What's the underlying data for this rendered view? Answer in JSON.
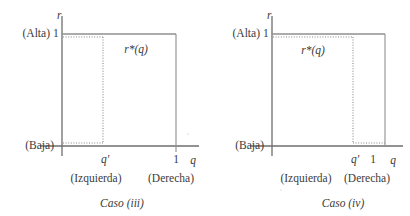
{
  "figure": {
    "panels": [
      {
        "id": "caso-iii",
        "caption": "Caso (iii)",
        "y_axis_name": "r",
        "x_axis_name": "q",
        "y_top_tick": "1",
        "y_top_qualifier": "(Alta)",
        "y_bottom_qualifier": "(Baja)",
        "x_ticks": [
          "q'",
          "1"
        ],
        "x_left_qualifier": "(Izquierda)",
        "x_right_qualifier": "(Derecha)",
        "curve_label": "r*(q)",
        "geometry": {
          "axis_x": 62,
          "baseline_y": 146,
          "top_y": 34,
          "q_prime_x": 103,
          "q_one_x": 176,
          "dotted_top_y": 37,
          "dotted_bottom_y": 143,
          "x_axis_end": 199,
          "y_axis_top": 16,
          "y_axis_bottom": 156
        }
      },
      {
        "id": "caso-iv",
        "caption": "Caso (iv)",
        "y_axis_name": "r",
        "x_axis_name": "q",
        "y_top_tick": "1",
        "y_top_qualifier": "(Alta)",
        "y_bottom_qualifier": "(Baja)",
        "x_ticks": [
          "q'",
          "1"
        ],
        "x_left_qualifier": "(Izquierda)",
        "x_right_qualifier": "(Derecha)",
        "curve_label": "r*(q)",
        "geometry": {
          "axis_x": 67,
          "baseline_y": 146,
          "top_y": 34,
          "q_prime_x": 148,
          "q_one_x": 167,
          "right_edge_x": 180,
          "dotted_top_y": 37,
          "dotted_bottom_y": 143,
          "x_axis_end": 198,
          "y_axis_top": 16,
          "y_axis_bottom": 156
        }
      }
    ],
    "colors": {
      "line": "#6e6e6e",
      "dotted": "#8a8a8a",
      "text": "#3b3b3b"
    }
  }
}
